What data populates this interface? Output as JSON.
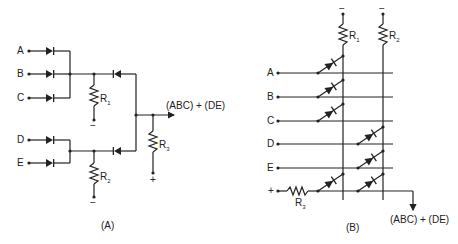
{
  "circuit_a": {
    "caption": "(A)",
    "inputs": [
      "A",
      "B",
      "C",
      "D",
      "E"
    ],
    "resistors": {
      "r1": "R",
      "r1_sub": "1",
      "r2": "R",
      "r2_sub": "2",
      "r3": "R",
      "r3_sub": "3"
    },
    "supply": {
      "minus": "−",
      "plus": "+"
    },
    "output": "(ABC) + (DE)"
  },
  "circuit_b": {
    "caption": "(B)",
    "inputs": [
      "A",
      "B",
      "C",
      "D",
      "E"
    ],
    "plus_input": "+",
    "resistors": {
      "r1": "R",
      "r1_sub": "1",
      "r2": "R",
      "r2_sub": "2",
      "r3": "R",
      "r3_sub": "3"
    },
    "supply": {
      "minus": "−"
    },
    "output": "(ABC) + (DE)"
  }
}
